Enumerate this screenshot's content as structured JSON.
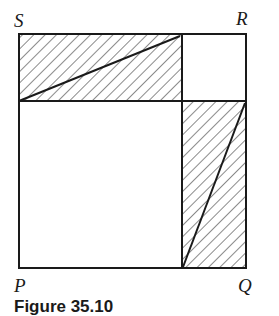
{
  "figure": {
    "labels": {
      "top_left": "S",
      "top_right": "R",
      "bottom_left": "P",
      "bottom_right": "Q"
    },
    "caption": "Figure 35.10",
    "colors": {
      "line": "#1a1a1a",
      "hatch": "#2a2a2a",
      "background": "#ffffff"
    },
    "regions": [
      {
        "name": "top-left-rectangle",
        "hatched": true,
        "diagonal": "bottom-left to top-right"
      },
      {
        "name": "top-right-square",
        "hatched": false
      },
      {
        "name": "bottom-left-square",
        "hatched": false
      },
      {
        "name": "bottom-right-rectangle",
        "hatched": true,
        "diagonal": "bottom-left to top-right"
      }
    ]
  }
}
